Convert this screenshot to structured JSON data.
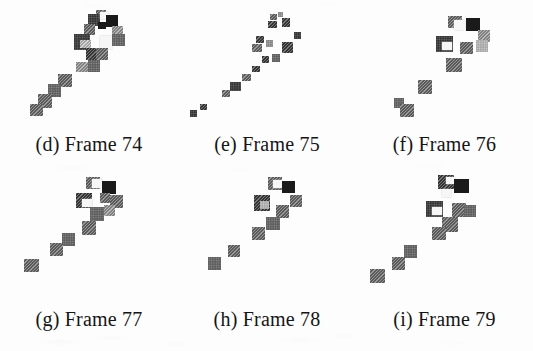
{
  "figure": {
    "background_color": "#fdfdfd",
    "ink_colors": {
      "black": "#1a1a1a",
      "dark_gray": "#3d3d3d",
      "mid_gray": "#6b6b6b",
      "light_gray": "#9a9a9a",
      "pale_gray": "#c3c3c3",
      "highlight_white": "#f6f6f6"
    },
    "grid": {
      "rows": 2,
      "columns": 3
    },
    "panels": [
      {
        "id": "d",
        "label": "(d) Frame 74",
        "letter": "(d)",
        "frame_word": "Frame",
        "frame_number": "74"
      },
      {
        "id": "e",
        "label": "(e) Frame 75",
        "letter": "(e)",
        "frame_word": "Frame",
        "frame_number": "75"
      },
      {
        "id": "f",
        "label": "(f) Frame 76",
        "letter": "(f)",
        "frame_word": "Frame",
        "frame_number": "76"
      },
      {
        "id": "g",
        "label": "(g) Frame 77",
        "letter": "(g)",
        "frame_word": "Frame",
        "frame_number": "77"
      },
      {
        "id": "h",
        "label": "(h) Frame 78",
        "letter": "(h)",
        "frame_word": "Frame",
        "frame_number": "78"
      },
      {
        "id": "i",
        "label": "(i) Frame 79",
        "letter": "(i)",
        "frame_word": "Frame",
        "frame_number": "79"
      }
    ]
  },
  "chart_data": {
    "type": "scatter",
    "title": "",
    "xlabel": "",
    "ylabel": "",
    "subplots": [
      {
        "id": "d",
        "caption": "(d) Frame 74",
        "blobs": [
          {
            "x": 96,
            "y": 10,
            "w": 10,
            "h": 8,
            "tone": "mid_gray"
          },
          {
            "x": 88,
            "y": 14,
            "w": 12,
            "h": 12,
            "tone": "dark_gray"
          },
          {
            "x": 100,
            "y": 12,
            "w": 9,
            "h": 7,
            "tone": "highlight_white"
          },
          {
            "x": 106,
            "y": 15,
            "w": 12,
            "h": 12,
            "tone": "black"
          },
          {
            "x": 98,
            "y": 22,
            "w": 8,
            "h": 7,
            "tone": "black"
          },
          {
            "x": 84,
            "y": 24,
            "w": 11,
            "h": 11,
            "tone": "mid_gray"
          },
          {
            "x": 112,
            "y": 26,
            "w": 11,
            "h": 11,
            "tone": "light_gray"
          },
          {
            "x": 74,
            "y": 34,
            "w": 16,
            "h": 16,
            "tone": "dark_gray"
          },
          {
            "x": 80,
            "y": 40,
            "w": 11,
            "h": 8,
            "tone": "pale_gray"
          },
          {
            "x": 100,
            "y": 36,
            "w": 12,
            "h": 13,
            "tone": "highlight_white"
          },
          {
            "x": 112,
            "y": 34,
            "w": 13,
            "h": 12,
            "tone": "mid_gray"
          },
          {
            "x": 86,
            "y": 48,
            "w": 12,
            "h": 12,
            "tone": "dark_gray"
          },
          {
            "x": 96,
            "y": 48,
            "w": 12,
            "h": 12,
            "tone": "mid_gray"
          },
          {
            "x": 88,
            "y": 60,
            "w": 12,
            "h": 12,
            "tone": "mid_gray"
          },
          {
            "x": 76,
            "y": 62,
            "w": 12,
            "h": 10,
            "tone": "light_gray"
          },
          {
            "x": 58,
            "y": 74,
            "w": 14,
            "h": 13,
            "tone": "mid_gray"
          },
          {
            "x": 48,
            "y": 84,
            "w": 13,
            "h": 13,
            "tone": "mid_gray"
          },
          {
            "x": 38,
            "y": 94,
            "w": 14,
            "h": 14,
            "tone": "mid_gray"
          },
          {
            "x": 30,
            "y": 104,
            "w": 13,
            "h": 12,
            "tone": "mid_gray"
          }
        ]
      },
      {
        "id": "e",
        "caption": "(e) Frame 75",
        "blobs": [
          {
            "x": 92,
            "y": 14,
            "w": 7,
            "h": 6,
            "tone": "mid_gray"
          },
          {
            "x": 100,
            "y": 12,
            "w": 5,
            "h": 5,
            "tone": "light_gray"
          },
          {
            "x": 90,
            "y": 21,
            "w": 9,
            "h": 7,
            "tone": "dark_gray"
          },
          {
            "x": 104,
            "y": 18,
            "w": 8,
            "h": 9,
            "tone": "dark_gray"
          },
          {
            "x": 116,
            "y": 32,
            "w": 7,
            "h": 7,
            "tone": "dark_gray"
          },
          {
            "x": 78,
            "y": 36,
            "w": 8,
            "h": 7,
            "tone": "dark_gray"
          },
          {
            "x": 74,
            "y": 44,
            "w": 10,
            "h": 8,
            "tone": "mid_gray"
          },
          {
            "x": 88,
            "y": 40,
            "w": 7,
            "h": 7,
            "tone": "light_gray"
          },
          {
            "x": 104,
            "y": 42,
            "w": 11,
            "h": 11,
            "tone": "dark_gray"
          },
          {
            "x": 84,
            "y": 56,
            "w": 7,
            "h": 7,
            "tone": "dark_gray"
          },
          {
            "x": 94,
            "y": 54,
            "w": 8,
            "h": 8,
            "tone": "mid_gray"
          },
          {
            "x": 74,
            "y": 66,
            "w": 8,
            "h": 6,
            "tone": "dark_gray"
          },
          {
            "x": 64,
            "y": 74,
            "w": 9,
            "h": 7,
            "tone": "mid_gray"
          },
          {
            "x": 52,
            "y": 82,
            "w": 11,
            "h": 9,
            "tone": "dark_gray"
          },
          {
            "x": 44,
            "y": 90,
            "w": 8,
            "h": 7,
            "tone": "mid_gray"
          },
          {
            "x": 22,
            "y": 104,
            "w": 7,
            "h": 6,
            "tone": "dark_gray"
          },
          {
            "x": 12,
            "y": 110,
            "w": 7,
            "h": 7,
            "tone": "dark_gray"
          }
        ]
      },
      {
        "id": "f",
        "caption": "(f) Frame 76",
        "blobs": [
          {
            "x": 92,
            "y": 16,
            "w": 14,
            "h": 12,
            "tone": "mid_gray"
          },
          {
            "x": 98,
            "y": 20,
            "w": 11,
            "h": 10,
            "tone": "highlight_white"
          },
          {
            "x": 110,
            "y": 18,
            "w": 14,
            "h": 13,
            "tone": "black"
          },
          {
            "x": 122,
            "y": 30,
            "w": 12,
            "h": 12,
            "tone": "light_gray"
          },
          {
            "x": 80,
            "y": 36,
            "w": 17,
            "h": 16,
            "tone": "dark_gray"
          },
          {
            "x": 86,
            "y": 42,
            "w": 10,
            "h": 8,
            "tone": "highlight_white"
          },
          {
            "x": 104,
            "y": 42,
            "w": 13,
            "h": 12,
            "tone": "mid_gray"
          },
          {
            "x": 120,
            "y": 40,
            "w": 12,
            "h": 12,
            "tone": "pale_gray"
          },
          {
            "x": 90,
            "y": 58,
            "w": 16,
            "h": 14,
            "tone": "mid_gray"
          },
          {
            "x": 62,
            "y": 80,
            "w": 14,
            "h": 14,
            "tone": "mid_gray"
          },
          {
            "x": 38,
            "y": 98,
            "w": 10,
            "h": 10,
            "tone": "mid_gray"
          },
          {
            "x": 44,
            "y": 104,
            "w": 14,
            "h": 13,
            "tone": "mid_gray"
          }
        ]
      },
      {
        "id": "g",
        "caption": "(g) Frame 77",
        "blobs": [
          {
            "x": 86,
            "y": 2,
            "w": 14,
            "h": 12,
            "tone": "mid_gray"
          },
          {
            "x": 92,
            "y": 4,
            "w": 10,
            "h": 9,
            "tone": "highlight_white"
          },
          {
            "x": 102,
            "y": 6,
            "w": 14,
            "h": 13,
            "tone": "black"
          },
          {
            "x": 76,
            "y": 18,
            "w": 16,
            "h": 15,
            "tone": "dark_gray"
          },
          {
            "x": 82,
            "y": 24,
            "w": 10,
            "h": 8,
            "tone": "highlight_white"
          },
          {
            "x": 100,
            "y": 18,
            "w": 10,
            "h": 10,
            "tone": "mid_gray"
          },
          {
            "x": 110,
            "y": 20,
            "w": 13,
            "h": 13,
            "tone": "mid_gray"
          },
          {
            "x": 90,
            "y": 32,
            "w": 14,
            "h": 14,
            "tone": "mid_gray"
          },
          {
            "x": 104,
            "y": 30,
            "w": 11,
            "h": 11,
            "tone": "light_gray"
          },
          {
            "x": 82,
            "y": 46,
            "w": 14,
            "h": 14,
            "tone": "mid_gray"
          },
          {
            "x": 62,
            "y": 58,
            "w": 13,
            "h": 13,
            "tone": "mid_gray"
          },
          {
            "x": 50,
            "y": 68,
            "w": 13,
            "h": 13,
            "tone": "mid_gray"
          },
          {
            "x": 24,
            "y": 84,
            "w": 15,
            "h": 13,
            "tone": "mid_gray"
          }
        ]
      },
      {
        "id": "h",
        "caption": "(h) Frame 78",
        "blobs": [
          {
            "x": 90,
            "y": 2,
            "w": 14,
            "h": 13,
            "tone": "mid_gray"
          },
          {
            "x": 95,
            "y": 5,
            "w": 9,
            "h": 8,
            "tone": "highlight_white"
          },
          {
            "x": 104,
            "y": 6,
            "w": 13,
            "h": 12,
            "tone": "black"
          },
          {
            "x": 76,
            "y": 20,
            "w": 16,
            "h": 16,
            "tone": "dark_gray"
          },
          {
            "x": 82,
            "y": 26,
            "w": 9,
            "h": 8,
            "tone": "pale_gray"
          },
          {
            "x": 112,
            "y": 20,
            "w": 12,
            "h": 12,
            "tone": "mid_gray"
          },
          {
            "x": 98,
            "y": 30,
            "w": 13,
            "h": 13,
            "tone": "mid_gray"
          },
          {
            "x": 88,
            "y": 42,
            "w": 14,
            "h": 13,
            "tone": "mid_gray"
          },
          {
            "x": 74,
            "y": 52,
            "w": 13,
            "h": 13,
            "tone": "mid_gray"
          },
          {
            "x": 50,
            "y": 70,
            "w": 12,
            "h": 12,
            "tone": "mid_gray"
          },
          {
            "x": 30,
            "y": 82,
            "w": 13,
            "h": 13,
            "tone": "mid_gray"
          }
        ]
      },
      {
        "id": "i",
        "caption": "(i) Frame 79",
        "blobs": [
          {
            "x": 82,
            "y": 0,
            "w": 16,
            "h": 14,
            "tone": "dark_gray"
          },
          {
            "x": 90,
            "y": 2,
            "w": 9,
            "h": 7,
            "tone": "highlight_white"
          },
          {
            "x": 98,
            "y": 4,
            "w": 15,
            "h": 14,
            "tone": "black"
          },
          {
            "x": 86,
            "y": 14,
            "w": 9,
            "h": 8,
            "tone": "highlight_white"
          },
          {
            "x": 70,
            "y": 26,
            "w": 17,
            "h": 16,
            "tone": "dark_gray"
          },
          {
            "x": 76,
            "y": 32,
            "w": 10,
            "h": 8,
            "tone": "highlight_white"
          },
          {
            "x": 96,
            "y": 28,
            "w": 14,
            "h": 14,
            "tone": "mid_gray"
          },
          {
            "x": 108,
            "y": 30,
            "w": 12,
            "h": 12,
            "tone": "mid_gray"
          },
          {
            "x": 86,
            "y": 42,
            "w": 16,
            "h": 15,
            "tone": "mid_gray"
          },
          {
            "x": 76,
            "y": 52,
            "w": 14,
            "h": 13,
            "tone": "mid_gray"
          },
          {
            "x": 48,
            "y": 70,
            "w": 13,
            "h": 13,
            "tone": "mid_gray"
          },
          {
            "x": 36,
            "y": 82,
            "w": 13,
            "h": 13,
            "tone": "mid_gray"
          },
          {
            "x": 14,
            "y": 94,
            "w": 15,
            "h": 14,
            "tone": "mid_gray"
          }
        ]
      }
    ]
  }
}
